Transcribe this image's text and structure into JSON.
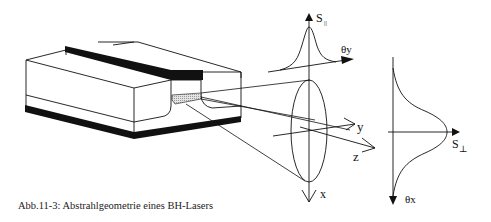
{
  "caption": "Abb.11-3: Abstrahlgeometrie eines BH-Lasers",
  "labels": {
    "s_parallel": "S",
    "s_parallel_sub": "||",
    "theta_y": "θy",
    "y_axis": "y",
    "z_axis": "z",
    "x_axis": "x",
    "s_perp": "S",
    "s_perp_sub": "⊥",
    "theta_x": "θx"
  },
  "colors": {
    "line": "#111111",
    "contact": "#111111",
    "active_region": "#d6d6d6"
  }
}
